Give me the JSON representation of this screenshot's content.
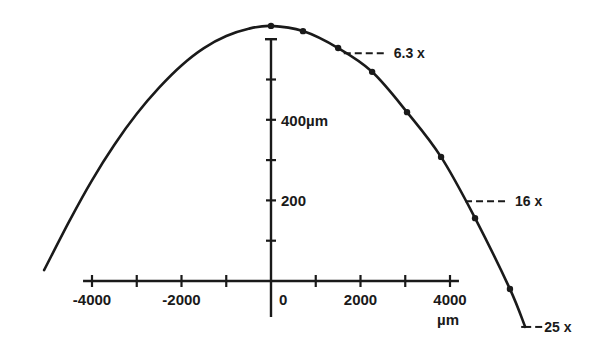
{
  "chart_data": {
    "type": "line",
    "title": "",
    "xlabel": "µm",
    "ylabel": "",
    "xlim": [
      -5200,
      5800
    ],
    "ylim": [
      -120,
      640
    ],
    "x_ticks": [
      -4000,
      -3000,
      -2000,
      -1000,
      0,
      1000,
      2000,
      3000,
      4000
    ],
    "x_tick_labels": [
      {
        "value": -4000,
        "label": "-4000"
      },
      {
        "value": -2000,
        "label": "-2000"
      },
      {
        "value": 0,
        "label": "0"
      },
      {
        "value": 2000,
        "label": "2000"
      },
      {
        "value": 4000,
        "label": "4000"
      }
    ],
    "y_ticks": [
      100,
      200,
      300,
      400,
      500,
      600
    ],
    "y_tick_labels": [
      {
        "value": 200,
        "label": "200"
      },
      {
        "value": 400,
        "label": "400µm"
      }
    ],
    "grid": false,
    "series": [
      {
        "name": "profile",
        "curve": [
          [
            -5070,
            27
          ],
          [
            -4500,
            150
          ],
          [
            -4000,
            250
          ],
          [
            -3500,
            338
          ],
          [
            -3000,
            415
          ],
          [
            -2500,
            480
          ],
          [
            -2000,
            535
          ],
          [
            -1500,
            578
          ],
          [
            -1000,
            608
          ],
          [
            -500,
            626
          ],
          [
            0,
            633
          ],
          [
            715,
            620
          ],
          [
            1500,
            578
          ],
          [
            2260,
            519
          ],
          [
            3040,
            419
          ],
          [
            3800,
            308
          ],
          [
            4560,
            156
          ],
          [
            5340,
            -20
          ],
          [
            5680,
            -114
          ]
        ],
        "markers": [
          [
            0,
            633
          ],
          [
            715,
            620
          ],
          [
            1500,
            578
          ],
          [
            2260,
            519
          ],
          [
            3040,
            419
          ],
          [
            3800,
            308
          ],
          [
            4560,
            156
          ],
          [
            5340,
            -20
          ]
        ]
      }
    ],
    "annotations": [
      {
        "label": "6.3 x",
        "x": 1760,
        "y": 565
      },
      {
        "label": "16 x",
        "x": 4470,
        "y": 198
      },
      {
        "label": "25 x",
        "x": 5680,
        "y": -114
      }
    ],
    "colors": {
      "ink": "#1a1a1a",
      "background": "#ffffff"
    }
  }
}
